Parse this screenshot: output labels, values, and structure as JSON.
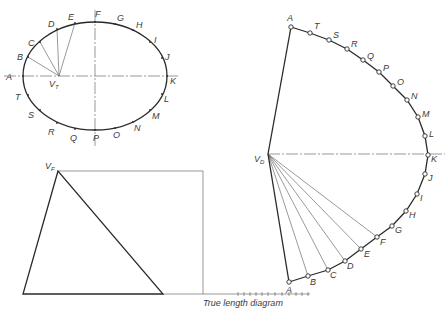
{
  "diagram": {
    "caption": "True length diagram",
    "top_view": {
      "apex_label": "V",
      "apex_sub": "T",
      "apex": [
        59,
        76
      ],
      "ellipse": {
        "cx": 95,
        "cy": 76,
        "rx": 72,
        "ry": 54
      },
      "points": [
        {
          "label": "A",
          "x": 23,
          "y": 76,
          "lx": 6,
          "ly": 80
        },
        {
          "label": "B",
          "x": 28,
          "y": 57,
          "lx": 17,
          "ly": 60
        },
        {
          "label": "C",
          "x": 40,
          "y": 42,
          "lx": 28,
          "ly": 46
        },
        {
          "label": "D",
          "x": 57,
          "y": 29,
          "lx": 48,
          "ly": 27
        },
        {
          "label": "E",
          "x": 75,
          "y": 23,
          "lx": 68,
          "ly": 20
        },
        {
          "label": "F",
          "x": 95,
          "y": 22,
          "lx": 95,
          "ly": 17
        },
        {
          "label": "G",
          "x": 115,
          "y": 24,
          "lx": 117,
          "ly": 21
        },
        {
          "label": "H",
          "x": 133,
          "y": 30,
          "lx": 136,
          "ly": 28
        },
        {
          "label": "I",
          "x": 150,
          "y": 42,
          "lx": 154,
          "ly": 43
        },
        {
          "label": "J",
          "x": 162,
          "y": 58,
          "lx": 165,
          "ly": 60
        },
        {
          "label": "K",
          "x": 167,
          "y": 76,
          "lx": 170,
          "ly": 84
        },
        {
          "label": "L",
          "x": 162,
          "y": 94,
          "lx": 164,
          "ly": 102
        },
        {
          "label": "M",
          "x": 150,
          "y": 110,
          "lx": 152,
          "ly": 119
        },
        {
          "label": "N",
          "x": 133,
          "y": 122,
          "lx": 134,
          "ly": 131
        },
        {
          "label": "O",
          "x": 115,
          "y": 128,
          "lx": 113,
          "ly": 138
        },
        {
          "label": "P",
          "x": 95,
          "y": 130,
          "lx": 93,
          "ly": 141
        },
        {
          "label": "Q",
          "x": 75,
          "y": 129,
          "lx": 70,
          "ly": 141
        },
        {
          "label": "R",
          "x": 57,
          "y": 123,
          "lx": 48,
          "ly": 135
        },
        {
          "label": "S",
          "x": 40,
          "y": 110,
          "lx": 28,
          "ly": 118
        },
        {
          "label": "T",
          "x": 28,
          "y": 95,
          "lx": 15,
          "ly": 100
        }
      ]
    },
    "front_view": {
      "apex_label": "V",
      "apex_sub": "F",
      "apex": [
        58,
        171
      ],
      "base_left": [
        23,
        294
      ],
      "base_right": [
        163,
        294
      ],
      "rect_right_x": 203,
      "baseline_end_x": 310,
      "ticks_x": [
        238,
        244,
        250,
        256,
        262,
        268,
        275,
        282,
        289,
        296,
        302,
        308
      ]
    },
    "development": {
      "apex_label": "V",
      "apex_sub": "D",
      "apex": [
        268,
        154
      ],
      "points": [
        {
          "label": "A",
          "x": 291,
          "y": 27,
          "lx": 287,
          "ly": 21
        },
        {
          "label": "T",
          "x": 310,
          "y": 33,
          "lx": 314,
          "ly": 29
        },
        {
          "label": "S",
          "x": 329,
          "y": 40,
          "lx": 333,
          "ly": 38
        },
        {
          "label": "R",
          "x": 347,
          "y": 49,
          "lx": 351,
          "ly": 47
        },
        {
          "label": "Q",
          "x": 363,
          "y": 60,
          "lx": 367,
          "ly": 59
        },
        {
          "label": "P",
          "x": 379,
          "y": 72,
          "lx": 383,
          "ly": 71
        },
        {
          "label": "O",
          "x": 393,
          "y": 86,
          "lx": 397,
          "ly": 85
        },
        {
          "label": "N",
          "x": 407,
          "y": 100,
          "lx": 411,
          "ly": 99
        },
        {
          "label": "M",
          "x": 418,
          "y": 117,
          "lx": 422,
          "ly": 117
        },
        {
          "label": "L",
          "x": 425,
          "y": 136,
          "lx": 429,
          "ly": 137
        },
        {
          "label": "K",
          "x": 428,
          "y": 155,
          "lx": 431,
          "ly": 162
        },
        {
          "label": "J",
          "x": 425,
          "y": 174,
          "lx": 428,
          "ly": 181
        },
        {
          "label": "I",
          "x": 417,
          "y": 194,
          "lx": 420,
          "ly": 201
        },
        {
          "label": "H",
          "x": 406,
          "y": 211,
          "lx": 409,
          "ly": 218
        },
        {
          "label": "G",
          "x": 392,
          "y": 226,
          "lx": 395,
          "ly": 233
        },
        {
          "label": "F",
          "x": 377,
          "y": 237,
          "lx": 380,
          "ly": 245
        },
        {
          "label": "E",
          "x": 361,
          "y": 249,
          "lx": 364,
          "ly": 257
        },
        {
          "label": "D",
          "x": 345,
          "y": 261,
          "lx": 347,
          "ly": 269
        },
        {
          "label": "C",
          "x": 328,
          "y": 270,
          "lx": 330,
          "ly": 278
        },
        {
          "label": "B",
          "x": 308,
          "y": 276,
          "lx": 310,
          "ly": 285
        },
        {
          "label": "A",
          "x": 289,
          "y": 282,
          "lx": 286,
          "ly": 293
        }
      ]
    }
  }
}
